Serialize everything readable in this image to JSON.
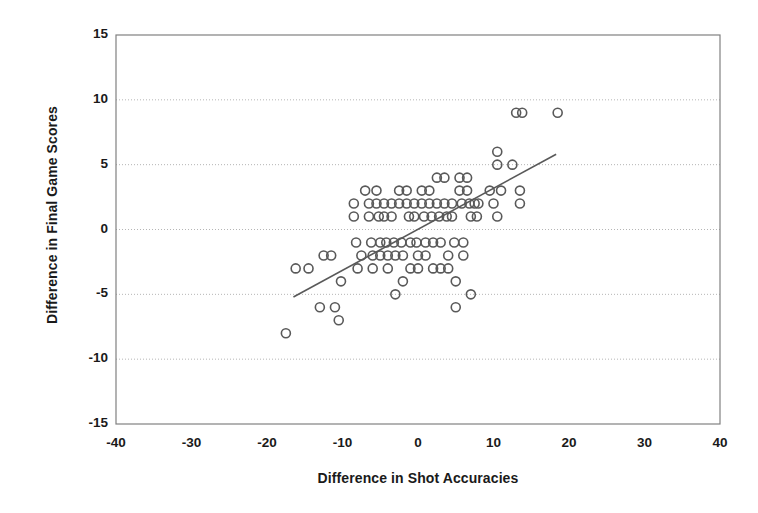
{
  "chart_data": {
    "type": "scatter",
    "title": "",
    "xlabel": "Difference in Shot Accuracies",
    "ylabel": "Difference in Final Game Scores",
    "xlim": [
      -40,
      40
    ],
    "ylim": [
      -15,
      15
    ],
    "xticks": [
      -40,
      -30,
      -20,
      -10,
      0,
      10,
      20,
      30,
      40
    ],
    "yticks": [
      -15,
      -10,
      -5,
      0,
      5,
      10,
      15
    ],
    "xtick_labels": [
      "-40",
      "-30",
      "-20",
      "-10",
      "0",
      "10",
      "20",
      "30",
      "40"
    ],
    "ytick_labels": [
      "-15",
      "-10",
      "-5",
      "0",
      "5",
      "10",
      "15"
    ],
    "grid": "horizontal-dotted",
    "legend": "none",
    "marker": "open-circle",
    "marker_color": "#595959",
    "marker_radius": 4.5,
    "points": [
      [
        -17.5,
        -8
      ],
      [
        -16.2,
        -3
      ],
      [
        -14.5,
        -3
      ],
      [
        -13.0,
        -6
      ],
      [
        -12.5,
        -2
      ],
      [
        -11.5,
        -2
      ],
      [
        -11.0,
        -6
      ],
      [
        -10.5,
        -7
      ],
      [
        -10.2,
        -4
      ],
      [
        -8.5,
        2
      ],
      [
        -8.5,
        1
      ],
      [
        -8.2,
        -1
      ],
      [
        -8.0,
        -3
      ],
      [
        -7.5,
        -2
      ],
      [
        -7.0,
        3
      ],
      [
        -6.5,
        2
      ],
      [
        -6.5,
        1
      ],
      [
        -6.2,
        -1
      ],
      [
        -6.0,
        -2
      ],
      [
        -6.0,
        -3
      ],
      [
        -5.5,
        3
      ],
      [
        -5.5,
        2
      ],
      [
        -5.2,
        1
      ],
      [
        -5.0,
        -1
      ],
      [
        -5.0,
        -2
      ],
      [
        -4.5,
        2
      ],
      [
        -4.5,
        1
      ],
      [
        -4.2,
        -1
      ],
      [
        -4.0,
        -2
      ],
      [
        -4.0,
        -3
      ],
      [
        -3.5,
        2
      ],
      [
        -3.5,
        1
      ],
      [
        -3.2,
        -1
      ],
      [
        -3.0,
        -2
      ],
      [
        -3.0,
        -5
      ],
      [
        -2.5,
        3
      ],
      [
        -2.5,
        2
      ],
      [
        -2.2,
        -1
      ],
      [
        -2.0,
        -2
      ],
      [
        -2.0,
        -4
      ],
      [
        -1.5,
        3
      ],
      [
        -1.5,
        2
      ],
      [
        -1.2,
        1
      ],
      [
        -1.0,
        -1
      ],
      [
        -1.0,
        -3
      ],
      [
        -0.5,
        2
      ],
      [
        -0.5,
        1
      ],
      [
        -0.2,
        -1
      ],
      [
        0.0,
        -2
      ],
      [
        0.0,
        -3
      ],
      [
        0.5,
        3
      ],
      [
        0.5,
        2
      ],
      [
        0.8,
        1
      ],
      [
        1.0,
        -1
      ],
      [
        1.0,
        -2
      ],
      [
        1.5,
        3
      ],
      [
        1.5,
        2
      ],
      [
        1.8,
        1
      ],
      [
        2.0,
        -1
      ],
      [
        2.0,
        -3
      ],
      [
        2.5,
        4
      ],
      [
        2.5,
        2
      ],
      [
        2.8,
        1
      ],
      [
        3.0,
        -1
      ],
      [
        3.0,
        -3
      ],
      [
        3.5,
        4
      ],
      [
        3.5,
        2
      ],
      [
        3.8,
        1
      ],
      [
        4.0,
        -2
      ],
      [
        4.0,
        -3
      ],
      [
        4.5,
        2
      ],
      [
        4.5,
        1
      ],
      [
        4.8,
        -1
      ],
      [
        5.0,
        -4
      ],
      [
        5.0,
        -6
      ],
      [
        5.5,
        4
      ],
      [
        5.5,
        3
      ],
      [
        5.8,
        2
      ],
      [
        6.0,
        -1
      ],
      [
        6.0,
        -2
      ],
      [
        6.5,
        4
      ],
      [
        6.5,
        3
      ],
      [
        6.8,
        2
      ],
      [
        7.0,
        -5
      ],
      [
        7.0,
        1
      ],
      [
        7.5,
        2
      ],
      [
        7.8,
        1
      ],
      [
        8.0,
        2
      ],
      [
        9.5,
        3
      ],
      [
        10.0,
        2
      ],
      [
        10.5,
        1
      ],
      [
        10.5,
        6
      ],
      [
        10.5,
        5
      ],
      [
        11.0,
        3
      ],
      [
        12.5,
        5
      ],
      [
        13.0,
        9
      ],
      [
        13.8,
        9
      ],
      [
        13.5,
        3
      ],
      [
        13.5,
        2
      ],
      [
        18.5,
        9
      ]
    ],
    "trendline": {
      "label": "linear-fit",
      "x1": -16.5,
      "y1": -5.2,
      "x2": 18.3,
      "y2": 5.8,
      "color": "#595959"
    }
  },
  "plot": {
    "border_color": "#808080",
    "gridline_color": "#b5b5b5",
    "background": "#ffffff"
  }
}
